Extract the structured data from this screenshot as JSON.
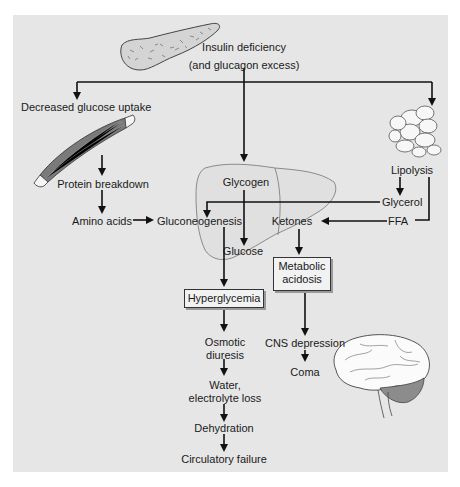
{
  "diagram": {
    "type": "flowchart",
    "colors": {
      "panel_background": "#e6e6e6",
      "arrow": "#111111",
      "box_fill": "#f2f2f2",
      "liver_outline": "#8a8a8a",
      "cerebellum_fill": "#8c8c8c"
    },
    "illustrations": [
      "pancreas",
      "muscle",
      "adipose-cells",
      "liver",
      "brain"
    ],
    "nodes": {
      "insulin_deficiency": {
        "line1": "Insulin deficiency",
        "line2": "(and glucagon excess)"
      },
      "decreased_glucose_uptake": "Decreased glucose uptake",
      "protein_breakdown": "Protein breakdown",
      "amino_acids": "Amino acids",
      "gluconeogenesis": "Gluconeogenesis",
      "glycogen": "Glycogen",
      "glucose": "Glucose",
      "lipolysis": "Lipolysis",
      "glycerol": "Glycerol",
      "ffa": "FFA",
      "ketones": "Ketones",
      "metabolic_acidosis": {
        "line1": "Metabolic",
        "line2": "acidosis"
      },
      "hyperglycemia": "Hyperglycemia",
      "osmotic_diuresis": {
        "line1": "Osmotic",
        "line2": "diuresis"
      },
      "cns_depression": "CNS depression",
      "coma": "Coma",
      "water_electrolyte_loss": {
        "line1": "Water,",
        "line2": "electrolyte loss"
      },
      "dehydration": "Dehydration",
      "circulatory_failure": "Circulatory failure"
    },
    "edges": [
      [
        "Insulin deficiency",
        "Decreased glucose uptake"
      ],
      [
        "Insulin deficiency",
        "Glycogen"
      ],
      [
        "Insulin deficiency",
        "Lipolysis"
      ],
      [
        "Decreased glucose uptake",
        "Protein breakdown"
      ],
      [
        "Protein breakdown",
        "Amino acids"
      ],
      [
        "Amino acids",
        "Gluconeogenesis"
      ],
      [
        "Glycogen",
        "Glucose"
      ],
      [
        "Gluconeogenesis",
        "Glucose"
      ],
      [
        "Lipolysis",
        "Glycerol"
      ],
      [
        "Lipolysis",
        "FFA"
      ],
      [
        "Glycerol",
        "Gluconeogenesis"
      ],
      [
        "FFA",
        "Ketones"
      ],
      [
        "Glucose",
        "Hyperglycemia"
      ],
      [
        "Ketones",
        "Metabolic acidosis"
      ],
      [
        "Metabolic acidosis",
        "CNS depression"
      ],
      [
        "CNS depression",
        "Coma"
      ],
      [
        "Hyperglycemia",
        "Osmotic diuresis"
      ],
      [
        "Osmotic diuresis",
        "Water, electrolyte loss"
      ],
      [
        "Water, electrolyte loss",
        "Dehydration"
      ],
      [
        "Dehydration",
        "Circulatory failure"
      ]
    ]
  }
}
